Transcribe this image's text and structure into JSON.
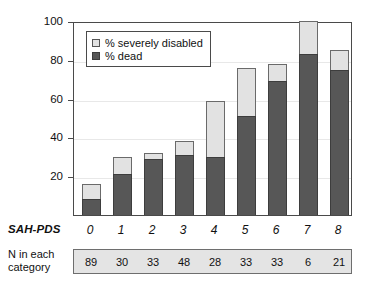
{
  "chart_data": {
    "type": "bar",
    "subtype": "stacked",
    "title": "",
    "xlabel": "SAH-PDS",
    "ylabel": "",
    "categories": [
      "0",
      "1",
      "2",
      "3",
      "4",
      "5",
      "6",
      "7",
      "8"
    ],
    "series": [
      {
        "name": "% dead",
        "color": "#575757",
        "values": [
          8,
          21,
          29,
          31,
          30,
          51,
          69,
          83,
          75
        ]
      },
      {
        "name": "% severely disabled",
        "color": "#e2e2e2",
        "values": [
          8,
          9,
          3,
          7,
          29,
          25,
          9,
          17,
          10
        ]
      }
    ],
    "cumulative_tops": [
      16,
      30,
      32,
      38,
      59,
      76,
      78,
      100,
      85
    ],
    "ylim": [
      0,
      100
    ],
    "yticks": [
      20,
      40,
      60,
      80,
      100
    ],
    "ytick_labels": [
      "20",
      "40",
      "60",
      "80",
      "100"
    ],
    "grid": true,
    "legend_position": "top-left",
    "annotations": {
      "n_row_label_line1": "N in each",
      "n_row_label_line2": "category",
      "n_values": [
        "89",
        "30",
        "33",
        "48",
        "28",
        "33",
        "33",
        "6",
        "21"
      ]
    }
  },
  "legend": {
    "items": [
      {
        "label": "% severely disabled",
        "swatch": "light"
      },
      {
        "label": "% dead",
        "swatch": "dark"
      }
    ]
  },
  "axis": {
    "x_title": "SAH-PDS"
  }
}
